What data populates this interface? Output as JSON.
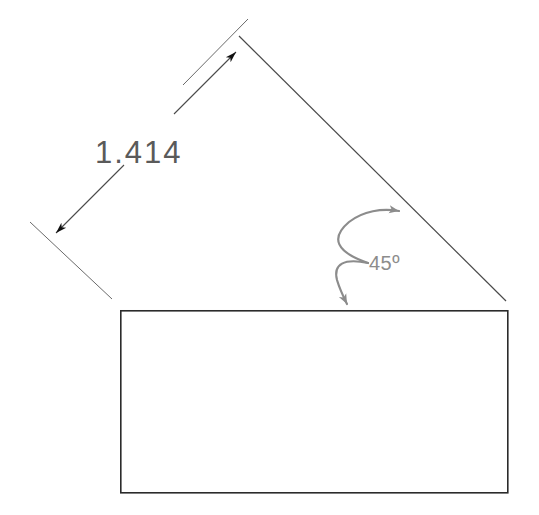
{
  "drawing": {
    "type": "engineering-dimension-diagram",
    "background_color": "#ffffff",
    "labels": {
      "length_dimension": "1.414",
      "angle_dimension": "45º"
    },
    "colors": {
      "outline_stroke": "#2b2b2b",
      "dimension_stroke": "#4a4a4a",
      "dimension_text": "#5a5a5a",
      "angle_arc": "#8c8c8c",
      "angle_text": "#8c8c8c",
      "arrowhead_fill": "#111111"
    },
    "shapes": {
      "rectangle": {
        "name": "base-rectangle",
        "x": 120,
        "y": 310,
        "width": 388,
        "height": 183,
        "stroke_width": 1.6
      },
      "hypotenuse": {
        "name": "inclined-edge",
        "x1": 239,
        "y1": 36,
        "x2": 506,
        "y2": 301,
        "angle_degrees": 45,
        "stroke_width": 1.1
      }
    },
    "dimension_line": {
      "name": "length-dimension-1414",
      "angle_degrees": 45,
      "upper_segment": {
        "x1": 175,
        "y1": 113,
        "x2": 238,
        "y2": 50
      },
      "lower_segment": {
        "x1": 123,
        "y1": 166,
        "x2": 54,
        "y2": 235
      },
      "upper_extension": {
        "x1": 247,
        "y1": 20,
        "x2": 186,
        "y2": 82
      },
      "lower_extension": {
        "x1": 31,
        "y1": 223,
        "x2": 111,
        "y2": 298
      },
      "text_position": {
        "x": 95,
        "y": 163
      }
    },
    "angle_arc": {
      "name": "angle-indicator-45",
      "start": {
        "x": 403,
        "y": 213
      },
      "end": {
        "x": 348,
        "y": 309
      },
      "control": {
        "x": 333,
        "y": 228
      },
      "stroke_width": 2.2,
      "text_position": {
        "x": 369,
        "y": 270
      }
    }
  }
}
